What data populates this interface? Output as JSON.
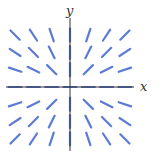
{
  "figure": {
    "type": "slope-field",
    "axis_labels": {
      "x": "x",
      "y": "y"
    },
    "colors": {
      "segment": "#5b7bd5",
      "axis": "#333333",
      "background": "#ffffff"
    },
    "grid": {
      "x_values": [
        -3,
        -2,
        -1,
        0,
        1,
        2,
        3
      ],
      "y_values": [
        3,
        2,
        1,
        0,
        -1,
        -2,
        -3
      ]
    },
    "slope_rule": "segments point radially away from the origin (slope = y/x); horizontal on x-axis, vertical on y-axis"
  }
}
